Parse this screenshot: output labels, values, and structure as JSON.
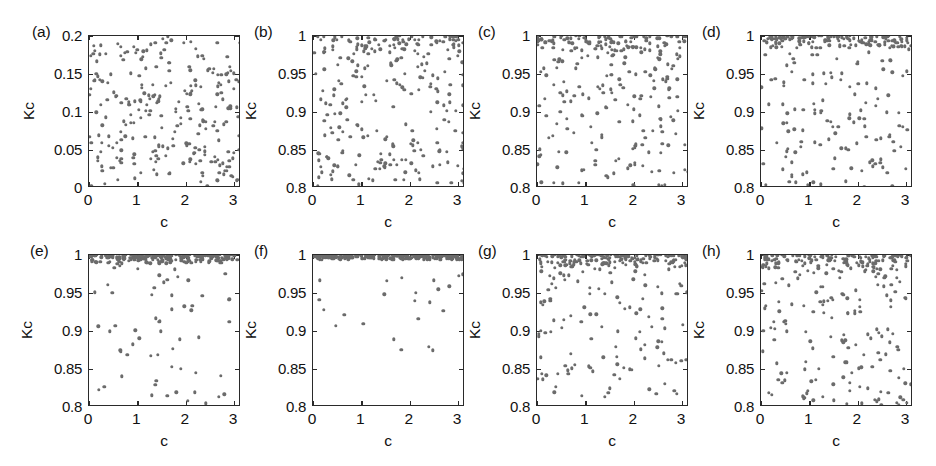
{
  "figure": {
    "axis_label_x": "c",
    "axis_label_y": "Kc",
    "dot_color": "#6b6b6b",
    "axis_color": "#2a2a2a",
    "background": "#ffffff",
    "rows": 2,
    "cols": 4
  },
  "chart_data": [
    {
      "type": "scatter",
      "panel": "(a)",
      "title": "",
      "xlabel": "c",
      "ylabel": "Kc",
      "xlim": [
        0,
        3.1416
      ],
      "ylim": [
        0,
        0.2
      ],
      "xticks": [
        0,
        1,
        2,
        3
      ],
      "xticklabels": [
        "0",
        "1",
        "2",
        "3"
      ],
      "yticks": [
        0,
        0.05,
        0.1,
        0.15,
        0.2
      ],
      "yticklabels": [
        "0",
        "0.05",
        "0.1",
        "0.15",
        "0.2"
      ],
      "grid": false,
      "legend": "none",
      "n_points": 260,
      "distribution": "uniform-scatter",
      "seed": 11,
      "band_fraction": 0.0,
      "band_top": 1.0,
      "lower_spread": [
        0.0,
        1.0
      ]
    },
    {
      "type": "scatter",
      "panel": "(b)",
      "title": "",
      "xlabel": "c",
      "ylabel": "Kc",
      "xlim": [
        0,
        3.1416
      ],
      "ylim": [
        0.8,
        1.0
      ],
      "xticks": [
        0,
        1,
        2,
        3
      ],
      "xticklabels": [
        "0",
        "1",
        "2",
        "3"
      ],
      "yticks": [
        0.8,
        0.85,
        0.9,
        0.95,
        1.0
      ],
      "yticklabels": [
        "0.8",
        "0.85",
        "0.9",
        "0.95",
        "1"
      ],
      "grid": false,
      "legend": "none",
      "n_points": 260,
      "distribution": "top-band-plus-uniform",
      "seed": 23,
      "band_fraction": 0.3,
      "band_top": 1.0,
      "lower_spread": [
        0.8,
        1.0
      ]
    },
    {
      "type": "scatter",
      "panel": "(c)",
      "title": "",
      "xlabel": "c",
      "ylabel": "Kc",
      "xlim": [
        0,
        3.1416
      ],
      "ylim": [
        0.8,
        1.0
      ],
      "xticks": [
        0,
        1,
        2,
        3
      ],
      "xticklabels": [
        "0",
        "1",
        "2",
        "3"
      ],
      "yticks": [
        0.8,
        0.85,
        0.9,
        0.95,
        1.0
      ],
      "yticklabels": [
        "0.8",
        "0.85",
        "0.9",
        "0.95",
        "1"
      ],
      "grid": false,
      "legend": "none",
      "n_points": 265,
      "distribution": "top-band-plus-uniform",
      "seed": 37,
      "band_fraction": 0.37,
      "band_top": 1.0,
      "lower_spread": [
        0.8,
        1.0
      ]
    },
    {
      "type": "scatter",
      "panel": "(d)",
      "title": "",
      "xlabel": "c",
      "ylabel": "Kc",
      "xlim": [
        0,
        3.1416
      ],
      "ylim": [
        0.8,
        1.0
      ],
      "xticks": [
        0,
        1,
        2,
        3
      ],
      "xticklabels": [
        "0",
        "1",
        "2",
        "3"
      ],
      "yticks": [
        0.8,
        0.85,
        0.9,
        0.95,
        1.0
      ],
      "yticklabels": [
        "0.8",
        "0.85",
        "0.9",
        "0.95",
        "1"
      ],
      "grid": false,
      "legend": "none",
      "n_points": 270,
      "distribution": "top-band-plus-uniform",
      "seed": 53,
      "band_fraction": 0.58,
      "band_top": 1.0,
      "lower_spread": [
        0.8,
        1.0
      ]
    },
    {
      "type": "scatter",
      "panel": "(e)",
      "title": "",
      "xlabel": "c",
      "ylabel": "Kc",
      "xlim": [
        0,
        3.1416
      ],
      "ylim": [
        0.8,
        1.0
      ],
      "xticks": [
        0,
        1,
        2,
        3
      ],
      "xticklabels": [
        "0",
        "1",
        "2",
        "3"
      ],
      "yticks": [
        0.8,
        0.85,
        0.9,
        0.95,
        1.0
      ],
      "yticklabels": [
        "0.8",
        "0.85",
        "0.9",
        "0.95",
        "1"
      ],
      "grid": false,
      "legend": "none",
      "n_points": 260,
      "distribution": "top-band-plus-uniform",
      "seed": 71,
      "band_fraction": 0.72,
      "band_top": 1.0,
      "lower_spread": [
        0.8,
        1.0
      ]
    },
    {
      "type": "scatter",
      "panel": "(f)",
      "title": "",
      "xlabel": "c",
      "ylabel": "Kc",
      "xlim": [
        0,
        3.1416
      ],
      "ylim": [
        0.8,
        1.0
      ],
      "xticks": [
        0,
        1,
        2,
        3
      ],
      "xticklabels": [
        "0",
        "1",
        "2",
        "3"
      ],
      "yticks": [
        0.8,
        0.85,
        0.9,
        0.95,
        1.0
      ],
      "yticklabels": [
        "0.8",
        "0.85",
        "0.9",
        "0.95",
        "1"
      ],
      "grid": false,
      "legend": "none",
      "n_points": 270,
      "distribution": "top-band-plus-uniform",
      "seed": 89,
      "band_fraction": 0.88,
      "band_top": 1.0,
      "lower_spread": [
        0.865,
        1.0
      ]
    },
    {
      "type": "scatter",
      "panel": "(g)",
      "title": "",
      "xlabel": "c",
      "ylabel": "Kc",
      "xlim": [
        0,
        3.1416
      ],
      "ylim": [
        0.8,
        1.0
      ],
      "xticks": [
        0,
        1,
        2,
        3
      ],
      "xticklabels": [
        "0",
        "1",
        "2",
        "3"
      ],
      "yticks": [
        0.8,
        0.85,
        0.9,
        0.95,
        1.0
      ],
      "yticklabels": [
        "0.8",
        "0.85",
        "0.9",
        "0.95",
        "1"
      ],
      "grid": false,
      "legend": "none",
      "n_points": 275,
      "distribution": "top-band-plus-uniform",
      "seed": 101,
      "band_fraction": 0.55,
      "band_top": 1.0,
      "lower_spread": [
        0.81,
        1.0
      ]
    },
    {
      "type": "scatter",
      "panel": "(h)",
      "title": "",
      "xlabel": "c",
      "ylabel": "Kc",
      "xlim": [
        0,
        3.1416
      ],
      "ylim": [
        0.8,
        1.0
      ],
      "xticks": [
        0,
        1,
        2,
        3
      ],
      "xticklabels": [
        "0",
        "1",
        "2",
        "3"
      ],
      "yticks": [
        0.8,
        0.85,
        0.9,
        0.95,
        1.0
      ],
      "yticklabels": [
        "0.8",
        "0.85",
        "0.9",
        "0.95",
        "1"
      ],
      "grid": false,
      "legend": "none",
      "n_points": 280,
      "distribution": "top-band-plus-uniform",
      "seed": 127,
      "band_fraction": 0.45,
      "band_top": 1.0,
      "lower_spread": [
        0.8,
        1.0
      ]
    }
  ],
  "geometry": {
    "box_width": 152,
    "box_height": 152,
    "col_left": [
      88,
      312,
      536,
      760
    ],
    "row_top": [
      35,
      254
    ]
  }
}
